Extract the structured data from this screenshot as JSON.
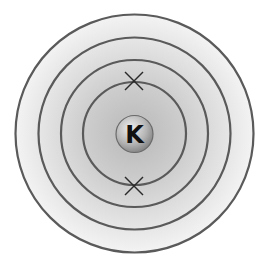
{
  "diagram": {
    "type": "bohr-electron-shell-diagram",
    "element_symbol": "K",
    "center": [
      134.5,
      133.5
    ],
    "shells": [
      {
        "index": 1,
        "radius": 51.5,
        "electrons": 2
      },
      {
        "index": 2,
        "radius": 73.5,
        "electrons": 0
      },
      {
        "index": 3,
        "radius": 96,
        "electrons": 0
      },
      {
        "index": 4,
        "radius": 119,
        "electrons": 0
      }
    ],
    "electron_marker": "cross",
    "colors": {
      "shell_stroke": "#555555",
      "background_outer": "#f4f4f4",
      "background_inner": "#bdbdbd",
      "nucleus_fill_light": "#e8e8e8",
      "nucleus_fill_dark": "#8a8a8a",
      "electron": "#222222"
    }
  }
}
